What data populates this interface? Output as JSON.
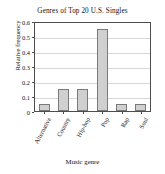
{
  "chart_data": {
    "type": "bar",
    "title": "Genres of Top 20 U.S. Singles",
    "xlabel": "Music genre",
    "ylabel": "Relative frequency",
    "categories": [
      "Alternative",
      "Country",
      "Hip-hop",
      "Pop",
      "Rap",
      "Soul"
    ],
    "values": [
      0.05,
      0.15,
      0.15,
      0.55,
      0.05,
      0.05
    ],
    "ylim": [
      0,
      0.6
    ],
    "ytick_labels": [
      "0.6",
      "0.5",
      "0.4",
      "0.3",
      "0.2",
      "0.1",
      "0"
    ],
    "ytick_values": [
      0.6,
      0.5,
      0.4,
      0.3,
      0.2,
      0.1,
      0
    ],
    "grid": true,
    "legend": false,
    "bar_fill_color": "#d0d0d0",
    "bar_edge_color": "#7a7a7a",
    "axis_color": "#4d4d4d",
    "grid_color": "#d8d8d8",
    "background_color": "#ffffff"
  }
}
